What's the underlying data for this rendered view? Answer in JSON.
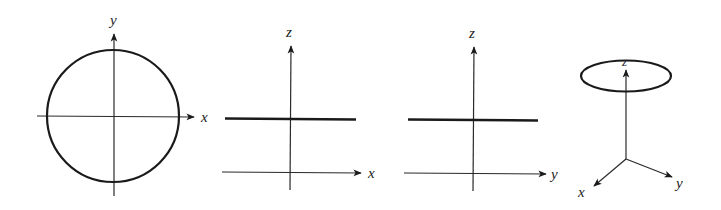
{
  "colors": {
    "stroke": "#1a1a1a",
    "axis": "#2a2a2a",
    "background": "#ffffff"
  },
  "panels": [
    {
      "id": "xy-view",
      "description": "Circle in the xy-plane (top view)",
      "axis_labels": {
        "horizontal": "x",
        "vertical": "y"
      },
      "shape": "circle"
    },
    {
      "id": "xz-view",
      "description": "Side view in the xz-plane; circle appears as a horizontal line",
      "axis_labels": {
        "horizontal": "x",
        "vertical": "z"
      },
      "shape": "line"
    },
    {
      "id": "yz-view",
      "description": "Side view in the yz-plane; circle appears as a horizontal line",
      "axis_labels": {
        "horizontal": "y",
        "vertical": "z"
      },
      "shape": "line"
    },
    {
      "id": "3d-view",
      "description": "Perspective 3D view; circle appears as an ellipse above origin",
      "axis_labels": {
        "x": "x",
        "y": "y",
        "z": "z"
      },
      "shape": "ellipse"
    }
  ]
}
